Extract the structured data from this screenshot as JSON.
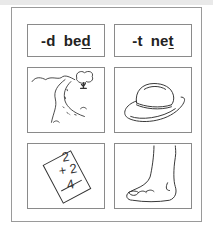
{
  "worksheet": {
    "word_cards": [
      {
        "suffix": "-d",
        "word_stem": "be",
        "word_final": "d"
      },
      {
        "suffix": "-t",
        "word_stem": "ne",
        "word_final": "t"
      }
    ],
    "pictures": [
      {
        "label": "road"
      },
      {
        "label": "hat"
      },
      {
        "label": "card",
        "problem": {
          "top": "2",
          "addend": "+ 2",
          "answer": "4"
        }
      },
      {
        "label": "foot"
      }
    ]
  }
}
